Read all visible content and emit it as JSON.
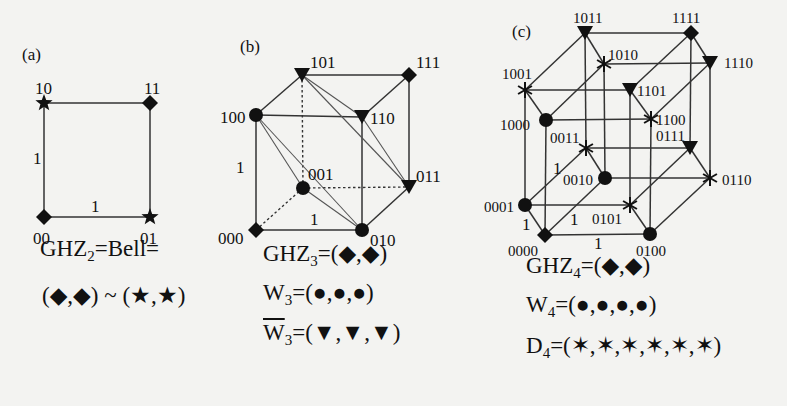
{
  "panels": [
    {
      "id": "a",
      "label": "(a)",
      "label_pos": [
        22,
        60
      ],
      "nodes": [
        {
          "name": "00",
          "x": 44,
          "y": 217,
          "shape": "diamond",
          "lx": 33,
          "ly": 244
        },
        {
          "name": "01",
          "x": 150,
          "y": 217,
          "shape": "star",
          "lx": 140,
          "ly": 244
        },
        {
          "name": "10",
          "x": 44,
          "y": 103,
          "shape": "star",
          "lx": 35,
          "ly": 94
        },
        {
          "name": "11",
          "x": 150,
          "y": 103,
          "shape": "diamond",
          "lx": 144,
          "ly": 94
        }
      ],
      "edges": [
        [
          "00",
          "01",
          "solid"
        ],
        [
          "00",
          "10",
          "solid"
        ],
        [
          "10",
          "11",
          "solid"
        ],
        [
          "01",
          "11",
          "solid"
        ]
      ],
      "weights": [
        {
          "text": "1",
          "x": 33,
          "y": 164
        },
        {
          "text": "1",
          "x": 91,
          "y": 212
        }
      ]
    },
    {
      "id": "b",
      "label": "(b)",
      "label_pos": [
        240,
        52
      ],
      "nodes": [
        {
          "name": "000",
          "x": 256,
          "y": 230,
          "shape": "diamond",
          "lx": 218,
          "ly": 244
        },
        {
          "name": "001",
          "x": 303,
          "y": 188,
          "shape": "circle",
          "lx": 308,
          "ly": 180
        },
        {
          "name": "010",
          "x": 362,
          "y": 230,
          "shape": "circle",
          "lx": 370,
          "ly": 246
        },
        {
          "name": "011",
          "x": 409,
          "y": 187,
          "shape": "triangle",
          "lx": 416,
          "ly": 182
        },
        {
          "name": "100",
          "x": 256,
          "y": 115,
          "shape": "circle",
          "lx": 220,
          "ly": 123
        },
        {
          "name": "101",
          "x": 302,
          "y": 75,
          "shape": "triangle",
          "lx": 310,
          "ly": 68
        },
        {
          "name": "110",
          "x": 362,
          "y": 117,
          "shape": "triangle",
          "lx": 370,
          "ly": 124
        },
        {
          "name": "111",
          "x": 409,
          "y": 75,
          "shape": "diamond",
          "lx": 416,
          "ly": 68
        }
      ],
      "edges": [
        [
          "100",
          "101",
          "solid"
        ],
        [
          "101",
          "111",
          "solid"
        ],
        [
          "111",
          "110",
          "solid"
        ],
        [
          "100",
          "110",
          "solid"
        ],
        [
          "100",
          "000",
          "solid"
        ],
        [
          "110",
          "010",
          "solid"
        ],
        [
          "111",
          "011",
          "solid"
        ],
        [
          "000",
          "010",
          "solid"
        ],
        [
          "010",
          "011",
          "solid"
        ],
        [
          "101",
          "001",
          "dashed"
        ],
        [
          "001",
          "011",
          "dashed"
        ],
        [
          "000",
          "001",
          "dashed"
        ],
        [
          "100",
          "001",
          "thin"
        ],
        [
          "100",
          "010",
          "thin"
        ],
        [
          "001",
          "010",
          "thin"
        ],
        [
          "101",
          "110",
          "thin"
        ],
        [
          "101",
          "011",
          "thin"
        ],
        [
          "110",
          "011",
          "thin"
        ]
      ],
      "weights": [
        {
          "text": "1",
          "x": 236,
          "y": 173
        },
        {
          "text": "1",
          "x": 310,
          "y": 225
        }
      ]
    },
    {
      "id": "c",
      "label": "(c)",
      "label_pos": [
        512,
        37
      ],
      "nodes": [
        {
          "name": "0000",
          "x": 545,
          "y": 235,
          "shape": "diamond",
          "lx": 508,
          "ly": 256
        },
        {
          "name": "0001",
          "x": 525,
          "y": 205,
          "shape": "circle",
          "lx": 484,
          "ly": 212
        },
        {
          "name": "0010",
          "x": 605,
          "y": 178,
          "shape": "circle",
          "lx": 563,
          "ly": 185
        },
        {
          "name": "0011",
          "x": 586,
          "y": 148,
          "shape": "star",
          "lx": 550,
          "ly": 143
        },
        {
          "name": "0100",
          "x": 650,
          "y": 234,
          "shape": "circle",
          "lx": 636,
          "ly": 256
        },
        {
          "name": "0101",
          "x": 630,
          "y": 205,
          "shape": "star",
          "lx": 592,
          "ly": 224
        },
        {
          "name": "0110",
          "x": 710,
          "y": 178,
          "shape": "star",
          "lx": 722,
          "ly": 185
        },
        {
          "name": "0111",
          "x": 690,
          "y": 148,
          "shape": "triangle",
          "lx": 656,
          "ly": 141
        },
        {
          "name": "1000",
          "x": 546,
          "y": 120,
          "shape": "circle",
          "lx": 500,
          "ly": 130
        },
        {
          "name": "1001",
          "x": 525,
          "y": 90,
          "shape": "star",
          "lx": 502,
          "ly": 79
        },
        {
          "name": "1010",
          "x": 604,
          "y": 64,
          "shape": "star",
          "lx": 608,
          "ly": 60
        },
        {
          "name": "1011",
          "x": 585,
          "y": 33,
          "shape": "triangle",
          "lx": 573,
          "ly": 23
        },
        {
          "name": "1100",
          "x": 651,
          "y": 119,
          "shape": "star",
          "lx": 656,
          "ly": 125
        },
        {
          "name": "1101",
          "x": 630,
          "y": 90,
          "shape": "triangle",
          "lx": 637,
          "ly": 96
        },
        {
          "name": "1110",
          "x": 710,
          "y": 63,
          "shape": "triangle",
          "lx": 724,
          "ly": 68
        },
        {
          "name": "1111",
          "x": 691,
          "y": 33,
          "shape": "diamond",
          "lx": 672,
          "ly": 23
        }
      ],
      "edges": [
        [
          "1011",
          "1111",
          "solid"
        ],
        [
          "1010",
          "1110",
          "solid"
        ],
        [
          "1001",
          "1101",
          "solid"
        ],
        [
          "1000",
          "1100",
          "solid"
        ],
        [
          "1001",
          "1011",
          "solid"
        ],
        [
          "1000",
          "1010",
          "solid"
        ],
        [
          "1101",
          "1111",
          "solid"
        ],
        [
          "1100",
          "1110",
          "solid"
        ],
        [
          "1011",
          "1010",
          "solid"
        ],
        [
          "1001",
          "1000",
          "solid"
        ],
        [
          "1111",
          "1110",
          "solid"
        ],
        [
          "1101",
          "1100",
          "solid"
        ],
        [
          "0011",
          "0111",
          "solid"
        ],
        [
          "0010",
          "0110",
          "solid"
        ],
        [
          "0001",
          "0101",
          "solid"
        ],
        [
          "0000",
          "0100",
          "solid"
        ],
        [
          "0001",
          "0011",
          "solid"
        ],
        [
          "0000",
          "0010",
          "solid"
        ],
        [
          "0101",
          "0111",
          "solid"
        ],
        [
          "0100",
          "0110",
          "solid"
        ],
        [
          "0011",
          "0010",
          "solid"
        ],
        [
          "0001",
          "0000",
          "solid"
        ],
        [
          "0111",
          "0110",
          "solid"
        ],
        [
          "0101",
          "0100",
          "solid"
        ],
        [
          "1000",
          "0000",
          "solid"
        ],
        [
          "1001",
          "0001",
          "solid"
        ],
        [
          "1010",
          "0010",
          "solid"
        ],
        [
          "1011",
          "0011",
          "solid"
        ],
        [
          "1100",
          "0100",
          "solid"
        ],
        [
          "1101",
          "0101",
          "solid"
        ],
        [
          "1110",
          "0110",
          "solid"
        ],
        [
          "1111",
          "0111",
          "solid"
        ]
      ],
      "weights": [
        {
          "text": "1",
          "x": 553,
          "y": 174
        },
        {
          "text": "1",
          "x": 522,
          "y": 230
        },
        {
          "text": "1",
          "x": 570,
          "y": 225
        },
        {
          "text": "1",
          "x": 594,
          "y": 249
        }
      ]
    }
  ],
  "formulas": {
    "a": [
      {
        "parts": [
          {
            "t": "GHZ"
          },
          {
            "sub": "2"
          },
          {
            "t": "=Bell="
          }
        ],
        "x": 40,
        "y": 260
      },
      {
        "parts": [
          {
            "t": "(◆,◆) ~ (★,★)"
          }
        ],
        "x": 42,
        "y": 306
      }
    ],
    "b": [
      {
        "parts": [
          {
            "t": "GHZ"
          },
          {
            "sub": "3"
          },
          {
            "t": "=(◆,◆)"
          }
        ],
        "x": 263,
        "y": 264
      },
      {
        "parts": [
          {
            "t": "W"
          },
          {
            "sub": "3"
          },
          {
            "t": "=(●,●,●)"
          }
        ],
        "x": 263,
        "y": 304
      },
      {
        "parts": [
          {
            "over": "W"
          },
          {
            "sub": "3"
          },
          {
            "t": "=(▼,▼,▼)"
          }
        ],
        "x": 263,
        "y": 344
      }
    ],
    "c": [
      {
        "parts": [
          {
            "t": "GHZ"
          },
          {
            "sub": "4"
          },
          {
            "t": "=(◆,◆)"
          }
        ],
        "x": 526,
        "y": 276
      },
      {
        "parts": [
          {
            "t": "W"
          },
          {
            "sub": "4"
          },
          {
            "t": "=(●,●,●,●)"
          }
        ],
        "x": 526,
        "y": 316
      },
      {
        "parts": [
          {
            "t": "D"
          },
          {
            "sub": "4"
          },
          {
            "t": "=(✶,✶,✶,✶,✶,✶)"
          }
        ],
        "x": 526,
        "y": 356
      }
    ]
  },
  "colors": {
    "ink": "#111111",
    "line": "#333333",
    "thin": "#555555",
    "paper": "#f3f3f1"
  }
}
